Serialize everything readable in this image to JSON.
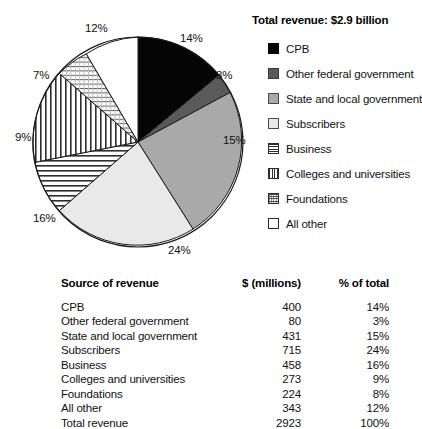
{
  "chart_data": {
    "type": "pie",
    "title": "Total revenue: $2.9 billion",
    "categories": [
      "CPB",
      "Other federal government",
      "State and local government",
      "Subscribers",
      "Business",
      "Colleges and universities",
      "Foundations",
      "All other"
    ],
    "values": [
      14,
      3,
      15,
      24,
      16,
      9,
      7,
      12
    ],
    "value_unit": "percent",
    "dollar_values": [
      400,
      80,
      431,
      715,
      458,
      273,
      224,
      343
    ],
    "dollar_unit": "millions",
    "slice_labels": [
      "14%",
      "3%",
      "15%",
      "24%",
      "16%",
      "9%",
      "7%",
      "12%"
    ],
    "total_dollars": 2923,
    "total_percent": "100%",
    "legend_position": "right",
    "fills": [
      "solid-black",
      "dark-gray",
      "mid-gray",
      "light-gray",
      "horizontal-lines",
      "vertical-lines",
      "dots",
      "white"
    ],
    "colors": {
      "solid-black": "#050505",
      "dark-gray": "#5a5a5a",
      "mid-gray": "#a9a9a9",
      "light-gray": "#e9e9e9",
      "white": "#ffffff",
      "line-stroke": "#2e2e2e",
      "outline": "#1a1a1a"
    }
  },
  "legend": {
    "title": "Total revenue: $2.9 billion",
    "items": [
      {
        "label": "CPB",
        "swatch": "sw-solid-black"
      },
      {
        "label": "Other federal government",
        "swatch": "sw-dark-gray"
      },
      {
        "label": "State and local government",
        "swatch": "sw-mid-gray"
      },
      {
        "label": "Subscribers",
        "swatch": "sw-light-gray"
      },
      {
        "label": "Business",
        "swatch": "sw-hlines"
      },
      {
        "label": "Colleges and universities",
        "swatch": "sw-vlines"
      },
      {
        "label": "Foundations",
        "swatch": "sw-dots"
      },
      {
        "label": "All other",
        "swatch": "sw-white"
      }
    ]
  },
  "pie_labels": [
    {
      "text": "14%",
      "left": 180,
      "top": 32
    },
    {
      "text": "3%",
      "left": 216,
      "top": 69
    },
    {
      "text": "15%",
      "left": 223,
      "top": 134
    },
    {
      "text": "24%",
      "left": 168,
      "top": 244
    },
    {
      "text": "16%",
      "left": 33,
      "top": 212
    },
    {
      "text": "9%",
      "left": 15,
      "top": 131
    },
    {
      "text": "7%",
      "left": 33,
      "top": 69
    },
    {
      "text": "12%",
      "left": 85,
      "top": 22
    }
  ],
  "table": {
    "headers": {
      "source": "Source of revenue",
      "dollars": "$ (millions)",
      "percent": "% of total"
    },
    "rows": [
      {
        "source": "CPB",
        "dollars": "400",
        "percent": "14%"
      },
      {
        "source": "Other federal government",
        "dollars": "80",
        "percent": "3%"
      },
      {
        "source": "State and local government",
        "dollars": "431",
        "percent": "15%"
      },
      {
        "source": "Subscribers",
        "dollars": "715",
        "percent": "24%"
      },
      {
        "source": "Business",
        "dollars": "458",
        "percent": "16%"
      },
      {
        "source": "Colleges and universities",
        "dollars": "273",
        "percent": "9%"
      },
      {
        "source": "Foundations",
        "dollars": "224",
        "percent": "8%"
      },
      {
        "source": "All other",
        "dollars": "343",
        "percent": "12%"
      },
      {
        "source": "Total revenue",
        "dollars": "2923",
        "percent": "100%"
      }
    ]
  }
}
